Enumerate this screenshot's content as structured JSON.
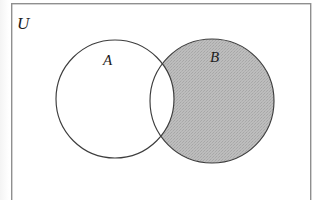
{
  "figure": {
    "type": "venn-diagram",
    "title": "",
    "universe": {
      "label": "U",
      "shape": "rectangle",
      "x": 11,
      "y": 3,
      "width": 300,
      "height": 205,
      "stroke_color": "#8a8a8a",
      "fill_color": "#ffffff",
      "stroke_width": 1.4
    },
    "sets": [
      {
        "id": "A",
        "label": "A",
        "cx": 115,
        "cy": 99,
        "r": 59,
        "fill_color": "#ffffff",
        "stroke_color": "#3a3a3a",
        "shaded": false,
        "label_x": 103,
        "label_y": 53
      },
      {
        "id": "B",
        "label": "B",
        "cx": 212,
        "cy": 101,
        "r": 62,
        "fill_color": "#b8b8b8",
        "stroke_color": "#3a3a3a",
        "shaded": true,
        "label_x": 210,
        "label_y": 50
      }
    ],
    "shaded_region": {
      "name": "B minus A",
      "notation": "B \\ A",
      "fill_color": "#b8b8b8"
    },
    "unshaded_regions": [
      {
        "name": "A minus B",
        "notation": "A \\ B",
        "fill_color": "#ffffff"
      },
      {
        "name": "A intersect B",
        "notation": "A ∩ B",
        "fill_color": "#ffffff"
      },
      {
        "name": "outside A and B",
        "notation": "(A ∪ B)'",
        "fill_color": "#ffffff"
      }
    ]
  }
}
